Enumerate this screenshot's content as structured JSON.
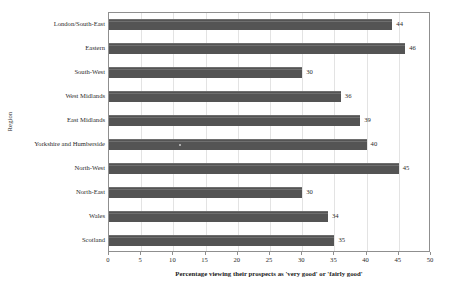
{
  "chart_data": {
    "type": "bar",
    "orientation": "horizontal",
    "title": "",
    "xlabel": "Percentage viewing their prospects as 'very good' or 'fairly good'",
    "ylabel": "Region",
    "categories": [
      "London/South-East",
      "Eastern",
      "South-West",
      "West Midlands",
      "East Midlands",
      "Yorkshire and Humberside",
      "North-West",
      "North-East",
      "Wales",
      "Scotland"
    ],
    "values": [
      44,
      46,
      30,
      36,
      39,
      40,
      45,
      30,
      34,
      35
    ],
    "xlim": [
      0,
      50
    ],
    "xticks": [
      0,
      5,
      10,
      15,
      20,
      25,
      30,
      35,
      40,
      45,
      50
    ],
    "xtick_labels": [
      "0",
      "5",
      "10",
      "15",
      "20",
      "25",
      "30",
      "35",
      "40",
      "45",
      "50"
    ],
    "grid": true,
    "grid_axis": "x",
    "legend": false,
    "data_labels": true,
    "bar_color": "#545454",
    "grid_color": "#e3e3e3",
    "frame_color": "#8f8f8f",
    "background": "#ffffff"
  }
}
